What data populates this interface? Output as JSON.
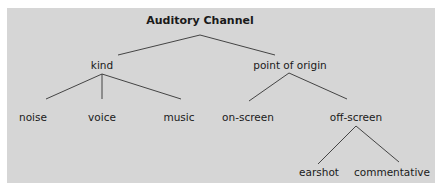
{
  "diagram": {
    "type": "tree",
    "root": {
      "label": "Auditory Channel"
    },
    "level1": [
      {
        "label": "kind"
      },
      {
        "label": "point of origin"
      }
    ],
    "kind_children": [
      {
        "label": "noise"
      },
      {
        "label": "voice"
      },
      {
        "label": "music"
      }
    ],
    "origin_children": [
      {
        "label": "on-screen"
      },
      {
        "label": "off-screen"
      }
    ],
    "offscreen_children": [
      {
        "label": "earshot"
      },
      {
        "label": "commentative"
      }
    ],
    "colors": {
      "panel": "#d6d6d6",
      "line": "#333333",
      "text": "#1a1a1a"
    }
  }
}
